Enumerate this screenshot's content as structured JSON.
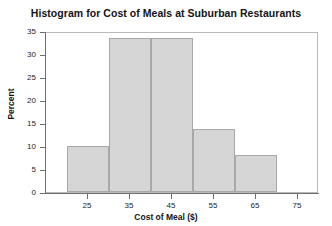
{
  "chart_data": {
    "type": "bar",
    "title": "Histogram for Cost of Meals at Suburban Restaurants",
    "xlabel": "Cost of Meal ($)",
    "ylabel": "Percent",
    "grid": false,
    "legend": null,
    "xlim": [
      15,
      80
    ],
    "ylim": [
      0,
      35
    ],
    "xticks": [
      25,
      35,
      45,
      55,
      65,
      75
    ],
    "xtick_labels": [
      "25",
      "35",
      "45",
      "55",
      "65",
      "75"
    ],
    "yticks": [
      0,
      5,
      10,
      15,
      20,
      25,
      30,
      35
    ],
    "ytick_labels": [
      "0",
      "5",
      "10",
      "15",
      "20",
      "25",
      "30",
      "35"
    ],
    "bin_edges": [
      20,
      30,
      40,
      50,
      60,
      70
    ],
    "categories": [
      "20-30",
      "30-40",
      "40-50",
      "50-60",
      "60-70"
    ],
    "values": [
      10,
      33.5,
      33.5,
      13.8,
      8
    ],
    "bar_color": "#d5d5d5",
    "bar_edge_color": "#a8a8a8",
    "axis_color": "#6e6e6e",
    "frame_color": "#b9b9b9",
    "background": "#ffffff"
  }
}
